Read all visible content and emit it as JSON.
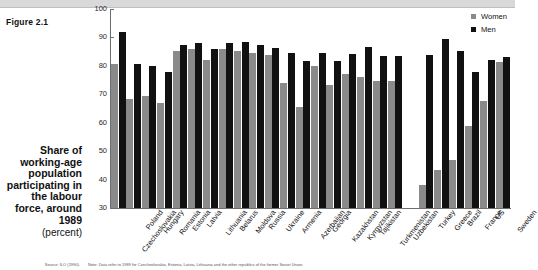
{
  "figure": {
    "label": "Figure 2.1",
    "caption_title": "Share of working-age population participating in the labour force, around 1989",
    "caption_unit": "(percent)",
    "source_note": "Source: ILO (1990).",
    "chart_note": "Note: Data refer to 1989 for Czechoslovakia, Estonia, Latvia, Lithuania and the other republics of the former Soviet Union."
  },
  "legend": {
    "position": "top-right",
    "entries": [
      {
        "label": "Women",
        "color": "#8a8a8a"
      },
      {
        "label": "Men",
        "color": "#111111"
      }
    ]
  },
  "axis": {
    "y_ticks": [
      "100",
      "90",
      "80",
      "70",
      "60",
      "50",
      "40",
      "30"
    ],
    "y_min": 30,
    "y_max": 100
  },
  "chart_data": {
    "type": "bar",
    "title": "Share of working-age population participating in the labour force, around 1989",
    "xlabel": "",
    "ylabel": "(percent)",
    "ylim": [
      30,
      100
    ],
    "grid": false,
    "legend_position": "top-right",
    "categories": [
      "Czechoslovakia",
      "Poland",
      "Hungary",
      "Romania",
      "Estonia",
      "Latvia",
      "Lithuania",
      "Belarus",
      "Moldova",
      "Russia",
      "Ukraine",
      "Armenia",
      "Azerbaijan",
      "Georgia",
      "Kazakhstan",
      "Kyrgyzstan",
      "Tajikistan",
      "Turkmenistan",
      "Uzbekistan",
      "Turkey",
      "Greece",
      "Brazil",
      "France",
      "US",
      "Sweden"
    ],
    "gap_after_category": "Uzbekistan",
    "series": [
      {
        "name": "Women",
        "color": "#8a8a8a",
        "values": [
          80.5,
          68.3,
          69.5,
          67.1,
          85.2,
          86.0,
          82.1,
          85.8,
          85.1,
          84.4,
          84.0,
          74.0,
          65.6,
          80.0,
          73.3,
          77.0,
          76.0,
          74.8,
          74.8,
          38.0,
          43.5,
          47.0,
          59.0,
          67.5,
          81.2
        ]
      },
      {
        "name": "Men",
        "color": "#111111",
        "values": [
          92.0,
          80.8,
          80.0,
          77.7,
          87.5,
          88.2,
          86.1,
          87.9,
          88.5,
          87.5,
          86.4,
          84.6,
          81.6,
          84.6,
          81.7,
          84.1,
          86.8,
          83.3,
          83.3,
          84.0,
          89.3,
          85.4,
          78.0,
          82.0,
          83.0
        ]
      }
    ]
  }
}
